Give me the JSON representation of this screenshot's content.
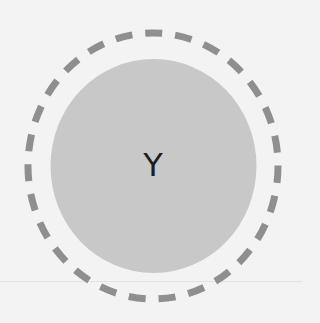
{
  "diagram": {
    "inner_circle": {
      "label": "Y",
      "fill": "#c8c8c8"
    },
    "outer_circle": {
      "style": "dashed",
      "stroke": "#8f8f8f"
    },
    "background": "#f3f3f3"
  }
}
